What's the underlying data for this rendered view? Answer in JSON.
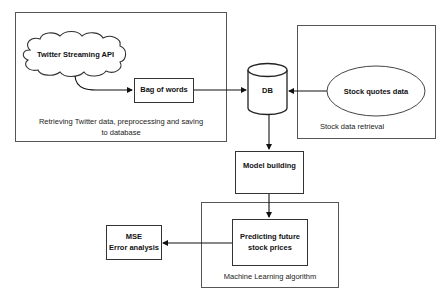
{
  "groups": {
    "twitter": {
      "caption_line1": "Retrieving Twitter data,  preprocessing and saving",
      "caption_line2": "to database"
    },
    "stock": {
      "caption": "Stock data retrieval"
    },
    "ml": {
      "caption": "Machine Learning algorithm"
    }
  },
  "nodes": {
    "twitter_api": {
      "label": "Twitter Streaming API",
      "shape": "cloud"
    },
    "bag_of_words": {
      "label": "Bag of words",
      "shape": "rectangle"
    },
    "db": {
      "label": "DB",
      "shape": "cylinder"
    },
    "stock_quotes": {
      "label": "Stock quotes data",
      "shape": "ellipse"
    },
    "model_building": {
      "label": "Model building",
      "shape": "rectangle"
    },
    "predicting_line1": {
      "label": "Predicting future"
    },
    "predicting_line2": {
      "label": "stock prices"
    },
    "mse_line1": {
      "label": "MSE"
    },
    "mse_line2": {
      "label": "Error analysis"
    }
  },
  "edges": [
    {
      "from": "Twitter Streaming API",
      "to": "Bag of words"
    },
    {
      "from": "Bag of words",
      "to": "DB"
    },
    {
      "from": "Stock quotes data",
      "to": "DB"
    },
    {
      "from": "DB",
      "to": "Model building"
    },
    {
      "from": "Model building",
      "to": "Predicting future stock prices"
    },
    {
      "from": "Predicting future stock prices",
      "to": "MSE Error analysis"
    }
  ]
}
